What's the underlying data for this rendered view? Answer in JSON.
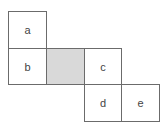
{
  "diagram": {
    "type": "cube-net",
    "cells": [
      {
        "id": "a",
        "label": "a",
        "shaded": false,
        "x": 8,
        "y": 11,
        "w": 39,
        "h": 38
      },
      {
        "id": "b",
        "label": "b",
        "shaded": false,
        "x": 8,
        "y": 48,
        "w": 39,
        "h": 37
      },
      {
        "id": "shaded",
        "label": "",
        "shaded": true,
        "x": 46,
        "y": 48,
        "w": 39,
        "h": 37
      },
      {
        "id": "c",
        "label": "c",
        "shaded": false,
        "x": 84,
        "y": 48,
        "w": 38,
        "h": 37
      },
      {
        "id": "d",
        "label": "d",
        "shaded": false,
        "x": 84,
        "y": 84,
        "w": 38,
        "h": 38
      },
      {
        "id": "e",
        "label": "e",
        "shaded": false,
        "x": 121,
        "y": 84,
        "w": 39,
        "h": 38
      }
    ],
    "colors": {
      "border": "#6b6b6b",
      "shaded_fill": "#d9d9d9",
      "text": "#444444"
    }
  }
}
